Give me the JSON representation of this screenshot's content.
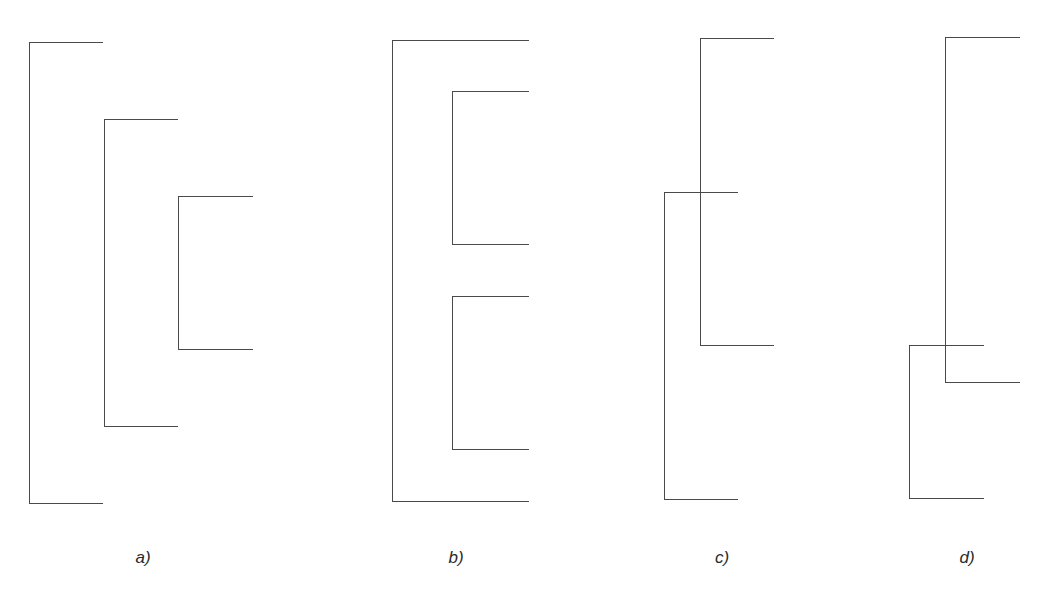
{
  "figure": {
    "line_color": "#4a4a4a",
    "label_color": "#2a2a2a",
    "panels": [
      {
        "id": "a",
        "label": "a)",
        "label_x": 143,
        "label_y": 548,
        "arrangement": "nested (staircase)",
        "brackets": [
          {
            "name": "outer",
            "x": 29,
            "top": 42,
            "bottom": 504,
            "arm_end": 103
          },
          {
            "name": "middle",
            "x": 104,
            "top": 119,
            "bottom": 427,
            "arm_end": 178
          },
          {
            "name": "inner",
            "x": 178,
            "top": 196,
            "bottom": 350,
            "arm_end": 253
          }
        ]
      },
      {
        "id": "b",
        "label": "b)",
        "label_x": 456,
        "label_y": 548,
        "arrangement": "sequential inside outer",
        "brackets": [
          {
            "name": "outer",
            "x": 392,
            "top": 40,
            "bottom": 502,
            "arm_end": 529
          },
          {
            "name": "inner-1",
            "x": 452,
            "top": 91,
            "bottom": 245,
            "arm_end": 529
          },
          {
            "name": "inner-2",
            "x": 452,
            "top": 296,
            "bottom": 450,
            "arm_end": 529
          }
        ]
      },
      {
        "id": "c",
        "label": "c)",
        "label_x": 722,
        "label_y": 548,
        "arrangement": "overlapping (invalid)",
        "brackets": [
          {
            "name": "first",
            "x": 700,
            "top": 38,
            "bottom": 346,
            "arm_end": 774
          },
          {
            "name": "second",
            "x": 664,
            "top": 192,
            "bottom": 500,
            "arm_end": 738
          }
        ]
      },
      {
        "id": "d",
        "label": "d)",
        "label_x": 967,
        "label_y": 548,
        "arrangement": "overlapping (invalid)",
        "brackets": [
          {
            "name": "first",
            "x": 945,
            "top": 37,
            "bottom": 383,
            "arm_end": 1020
          },
          {
            "name": "second",
            "x": 909,
            "top": 345,
            "bottom": 499,
            "arm_end": 984
          }
        ]
      }
    ]
  }
}
